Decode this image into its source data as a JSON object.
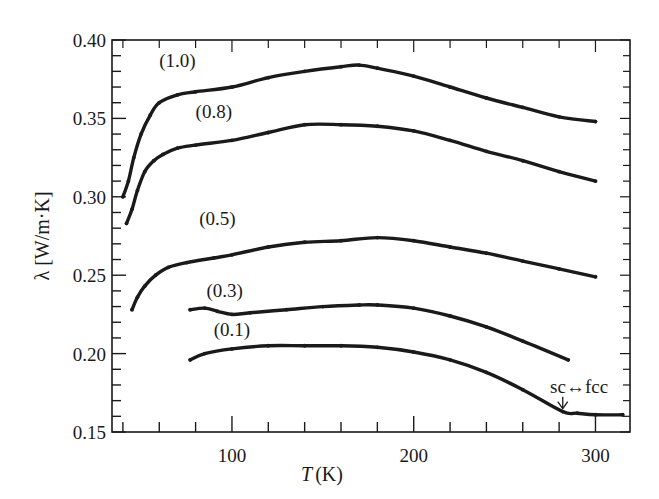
{
  "chart_data": {
    "type": "line",
    "title": "",
    "xlabel_italic": "T",
    "xlabel_unit": "(K)",
    "ylabel": "λ [W/m·K]",
    "xlim": [
      34,
      319
    ],
    "ylim": [
      0.15,
      0.4
    ],
    "x_major_ticks": [
      100,
      200,
      300
    ],
    "x_tick_labels": [
      "100",
      "200",
      "300"
    ],
    "x_minor_step": 20,
    "y_major_ticks": [
      0.15,
      0.2,
      0.25,
      0.3,
      0.35,
      0.4
    ],
    "y_tick_labels": [
      "0.15",
      "0.20",
      "0.25",
      "0.30",
      "0.35",
      "0.40"
    ],
    "y_minor_step": 0.01,
    "grid": false,
    "legend": "inline-labels",
    "series": [
      {
        "name": "(1.0)",
        "label_at": [
          60,
          0.383
        ],
        "x": [
          40,
          43,
          46,
          50,
          55,
          60,
          70,
          80,
          100,
          120,
          140,
          160,
          170,
          180,
          200,
          220,
          240,
          260,
          280,
          300
        ],
        "y": [
          0.3,
          0.31,
          0.325,
          0.34,
          0.352,
          0.36,
          0.365,
          0.367,
          0.37,
          0.376,
          0.38,
          0.383,
          0.384,
          0.382,
          0.377,
          0.37,
          0.363,
          0.357,
          0.351,
          0.348
        ]
      },
      {
        "name": "(0.8)",
        "label_at": [
          80,
          0.35
        ],
        "x": [
          42,
          45,
          48,
          52,
          57,
          62,
          70,
          80,
          100,
          120,
          140,
          160,
          180,
          200,
          220,
          240,
          260,
          280,
          300
        ],
        "y": [
          0.283,
          0.292,
          0.304,
          0.316,
          0.323,
          0.327,
          0.331,
          0.333,
          0.336,
          0.341,
          0.346,
          0.346,
          0.345,
          0.342,
          0.336,
          0.329,
          0.323,
          0.316,
          0.31
        ]
      },
      {
        "name": "(0.5)",
        "label_at": [
          82,
          0.282
        ],
        "x": [
          45,
          48,
          52,
          58,
          65,
          75,
          90,
          100,
          120,
          140,
          160,
          180,
          200,
          220,
          240,
          260,
          280,
          300
        ],
        "y": [
          0.228,
          0.236,
          0.243,
          0.25,
          0.255,
          0.258,
          0.261,
          0.263,
          0.268,
          0.271,
          0.272,
          0.274,
          0.272,
          0.268,
          0.264,
          0.259,
          0.254,
          0.249
        ]
      },
      {
        "name": "(0.3)",
        "label_at": [
          86,
          0.236
        ],
        "x": [
          77,
          85,
          92,
          100,
          110,
          130,
          150,
          170,
          180,
          200,
          220,
          240,
          260,
          285
        ],
        "y": [
          0.228,
          0.229,
          0.227,
          0.225,
          0.226,
          0.228,
          0.23,
          0.231,
          0.231,
          0.229,
          0.224,
          0.217,
          0.208,
          0.196
        ]
      },
      {
        "name": "(0.1)",
        "label_at": [
          90,
          0.211
        ],
        "x": [
          77,
          85,
          100,
          120,
          140,
          160,
          180,
          200,
          220,
          240,
          260,
          282,
          290,
          300,
          315
        ],
        "y": [
          0.196,
          0.2,
          0.203,
          0.205,
          0.205,
          0.205,
          0.204,
          0.201,
          0.196,
          0.188,
          0.177,
          0.163,
          0.162,
          0.161,
          0.161
        ]
      }
    ],
    "annotations": [
      {
        "text": "sc↔fcc",
        "points_to": [
          282,
          0.163
        ],
        "text_at": [
          291,
          0.175
        ]
      }
    ]
  }
}
